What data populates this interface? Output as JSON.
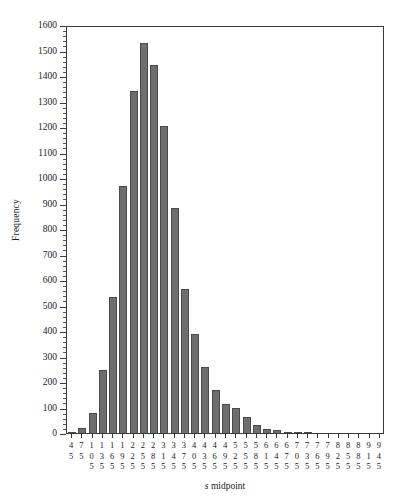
{
  "figure": {
    "background": "#ffffff",
    "frame_color": "#3a3a3a"
  },
  "axis": {
    "ylabel": "Frequency",
    "xlabel_italic": "s",
    "xlabel_rest": " midpoint",
    "xlabel_full": "s midpoint"
  },
  "chart_data": {
    "type": "bar",
    "title": "",
    "subtitle": "",
    "xlabel": "s midpoint",
    "ylabel": "Frequency",
    "ylim": [
      0,
      1600
    ],
    "ytick_step": 100,
    "yminor_step": 20,
    "grid": false,
    "legend": null,
    "bar_color": "#6e6e6e",
    "bar_edge_color": "#4a4a4a",
    "ytick_labels": [
      "0",
      "100",
      "200",
      "300",
      "400",
      "500",
      "600",
      "700",
      "800",
      "900",
      "1000",
      "1100",
      "1200",
      "1300",
      "1400",
      "1500",
      "1600"
    ],
    "categories": [
      "45",
      "75",
      "105",
      "135",
      "165",
      "195",
      "225",
      "255",
      "285",
      "315",
      "345",
      "375",
      "405",
      "435",
      "465",
      "495",
      "525",
      "555",
      "585",
      "615",
      "645",
      "675",
      "705",
      "735",
      "765",
      "795",
      "825",
      "855",
      "885",
      "915",
      "945"
    ],
    "values": [
      3,
      18,
      77,
      248,
      533,
      968,
      1340,
      1528,
      1445,
      1203,
      884,
      563,
      387,
      258,
      168,
      114,
      99,
      62,
      30,
      14,
      12,
      5,
      1,
      3,
      0,
      0,
      0,
      0,
      0,
      0,
      0
    ]
  }
}
